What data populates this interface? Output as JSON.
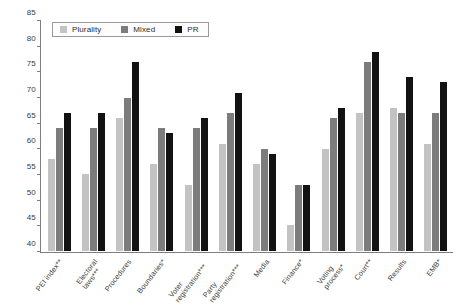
{
  "chart_data": {
    "type": "bar",
    "title": "",
    "subtitle": "",
    "xlabel": "",
    "ylabel": "",
    "ylim": [
      40,
      85
    ],
    "yticks": [
      40,
      45,
      50,
      55,
      60,
      65,
      70,
      75,
      80,
      85
    ],
    "grid": false,
    "legend_position": "top-left",
    "categories": [
      "PEI index**",
      "Electoral\nlaws***",
      "Procedures",
      "Boundaries*",
      "Voter\nregistration***",
      "Party\nregistration***",
      "Media",
      "Finance*",
      "Voting\nprocess*",
      "Court**",
      "Results",
      "EMB*"
    ],
    "series": [
      {
        "name": "Plurality",
        "color": "#c3c3c3",
        "values": [
          58,
          55,
          66,
          57,
          53,
          61,
          57,
          45,
          60,
          67,
          68,
          61
        ]
      },
      {
        "name": "Mixed",
        "color": "#7c7c7c",
        "values": [
          64,
          64,
          70,
          64,
          64,
          67,
          60,
          53,
          66,
          77,
          67,
          67
        ]
      },
      {
        "name": "PR",
        "color": "#121212",
        "values": [
          67,
          67,
          77,
          63,
          66,
          71,
          59,
          53,
          68,
          79,
          74,
          73
        ]
      }
    ]
  },
  "legend": {
    "items": [
      {
        "label": "Plurality",
        "swatch": "plurality-swatch"
      },
      {
        "label": "Mixed",
        "swatch": "mixed-swatch"
      },
      {
        "label": "PR",
        "swatch": "pr-swatch"
      }
    ]
  }
}
